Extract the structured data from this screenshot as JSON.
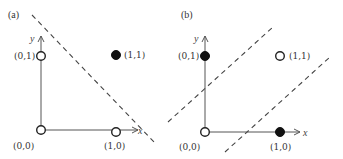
{
  "panels": [
    {
      "id": "a",
      "label": "(a)",
      "axis_x_label": "x",
      "axis_y_label": "y",
      "points": [
        {
          "label": "(0,0)",
          "class": "open"
        },
        {
          "label": "(0,1)",
          "class": "open"
        },
        {
          "label": "(1,0)",
          "class": "open"
        },
        {
          "label": "(1,1)",
          "class": "filled"
        }
      ],
      "separators": 1,
      "description": "Single linear decision boundary separating (1,1) from the others (AND function)"
    },
    {
      "id": "b",
      "label": "(b)",
      "axis_x_label": "x",
      "axis_y_label": "y",
      "points": [
        {
          "label": "(0,0)",
          "class": "open"
        },
        {
          "label": "(0,1)",
          "class": "filled"
        },
        {
          "label": "(1,0)",
          "class": "filled"
        },
        {
          "label": "(1,1)",
          "class": "open"
        }
      ],
      "separators": 2,
      "description": "Two linear boundaries needed to separate filled points (XOR function)"
    }
  ]
}
